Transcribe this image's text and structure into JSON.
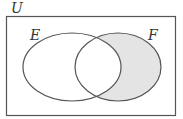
{
  "diagram": {
    "type": "venn",
    "universe_label": "U",
    "sets": [
      {
        "label": "E",
        "shaded": false
      },
      {
        "label": "F",
        "shaded": true
      }
    ],
    "shaded_region": "F minus E",
    "colors": {
      "stroke": "#555555",
      "shade": "#e4e4e4",
      "background": "#ffffff"
    }
  }
}
